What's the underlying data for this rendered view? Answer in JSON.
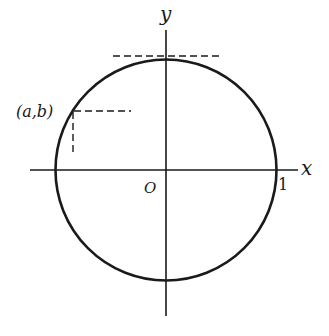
{
  "diagram": {
    "labels": {
      "x_axis": "x",
      "y_axis": "y",
      "origin": "O",
      "unit_mark": "1",
      "point": "(a,b)"
    },
    "circle": {
      "center": [
        0,
        0
      ],
      "radius": 1
    },
    "point": {
      "name": "(a,b)",
      "angle_deg": 122
    },
    "elements": [
      "x-axis",
      "y-axis",
      "unit-circle",
      "tangent-dashed-line-at-top",
      "horizontal-dashed-line-from-point",
      "vertical-dashed-line-from-point"
    ],
    "colors": {
      "stroke": "#1a1a1a",
      "background": "#ffffff"
    }
  }
}
